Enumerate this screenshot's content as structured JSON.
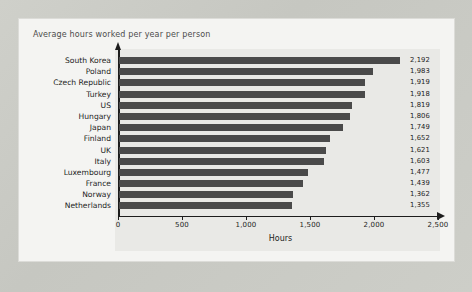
{
  "card": {
    "title": "Average hours worked per year per person"
  },
  "chart_data": {
    "type": "bar",
    "orientation": "horizontal",
    "title": "Average hours worked per year per person",
    "xlabel": "Hours",
    "ylabel": "",
    "xlim": [
      0,
      2500
    ],
    "xticks": [
      0,
      500,
      1000,
      1500,
      2000,
      2500
    ],
    "xtick_labels": [
      "0",
      "500",
      "1,000",
      "1,500",
      "2,000",
      "2,500"
    ],
    "grid": false,
    "legend": null,
    "bar_color": "#4a4a4a",
    "categories": [
      "South Korea",
      "Poland",
      "Czech Republic",
      "Turkey",
      "US",
      "Hungary",
      "Japan",
      "Finland",
      "UK",
      "Italy",
      "Luxembourg",
      "France",
      "Norway",
      "Netherlands"
    ],
    "values": [
      2192,
      1983,
      1919,
      1918,
      1819,
      1806,
      1749,
      1652,
      1621,
      1603,
      1477,
      1439,
      1362,
      1355
    ],
    "value_labels": [
      "2,192",
      "1,983",
      "1,919",
      "1,918",
      "1,819",
      "1,806",
      "1,749",
      "1,652",
      "1,621",
      "1,603",
      "1,477",
      "1,439",
      "1,362",
      "1,355"
    ]
  }
}
